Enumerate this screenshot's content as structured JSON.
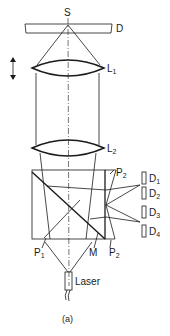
{
  "diagram": {
    "caption": "(a)",
    "labels": {
      "source": "S",
      "disk": "D",
      "lens1": "L",
      "lens1_sub": "1",
      "lens2": "L",
      "lens2_sub": "2",
      "prism1": "P",
      "prism1_sub": "1",
      "prism2_top": "P",
      "prism2_top_sub": "2",
      "prism2_bottom": "P",
      "prism2_bottom_sub": "2",
      "mirror": "M",
      "laser": "Laser",
      "detectors": [
        {
          "name": "D",
          "sub": "1"
        },
        {
          "name": "D",
          "sub": "2"
        },
        {
          "name": "D",
          "sub": "3"
        },
        {
          "name": "D",
          "sub": "4"
        }
      ]
    },
    "icons": {
      "focus_adjust": "double-arrow-vertical"
    },
    "colors": {
      "ink": "#1a1a1a",
      "background": "#ffffff"
    }
  }
}
